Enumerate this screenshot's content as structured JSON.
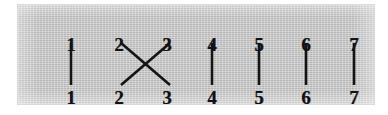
{
  "figure": {
    "panel_background_color": "#c9c9c9",
    "page_background_color": "#ffffff",
    "ink_color": "#141414"
  },
  "chart_data": {
    "type": "diagram",
    "title": "",
    "strand_count": 7,
    "top_labels": [
      "1",
      "2",
      "3",
      "4",
      "5",
      "6",
      "7"
    ],
    "bottom_labels": [
      "1",
      "2",
      "3",
      "4",
      "5",
      "6",
      "7"
    ],
    "top_label_x": [
      53,
      101,
      149,
      194,
      241,
      288,
      336
    ],
    "bottom_label_x": [
      53,
      101,
      149,
      194,
      241,
      288,
      336
    ],
    "top_label_y": 30,
    "bottom_label_y": 83,
    "strands": [
      {
        "from_top": "1",
        "to_bottom": "1",
        "kind": "straight",
        "x1": 53,
        "y1": 38,
        "x2": 53,
        "y2": 80
      },
      {
        "from_top": "2",
        "to_bottom": "3",
        "kind": "crossing",
        "x1": 103,
        "y1": 38,
        "x2": 152,
        "y2": 80
      },
      {
        "from_top": "3",
        "to_bottom": "2",
        "kind": "crossing",
        "x1": 152,
        "y1": 38,
        "x2": 103,
        "y2": 80
      },
      {
        "from_top": "4",
        "to_bottom": "4",
        "kind": "straight",
        "x1": 194,
        "y1": 38,
        "x2": 194,
        "y2": 80
      },
      {
        "from_top": "5",
        "to_bottom": "5",
        "kind": "straight",
        "x1": 241,
        "y1": 38,
        "x2": 241,
        "y2": 80
      },
      {
        "from_top": "6",
        "to_bottom": "6",
        "kind": "straight",
        "x1": 288,
        "y1": 38,
        "x2": 288,
        "y2": 80
      },
      {
        "from_top": "7",
        "to_bottom": "7",
        "kind": "straight",
        "x1": 336,
        "y1": 38,
        "x2": 336,
        "y2": 80
      }
    ]
  }
}
